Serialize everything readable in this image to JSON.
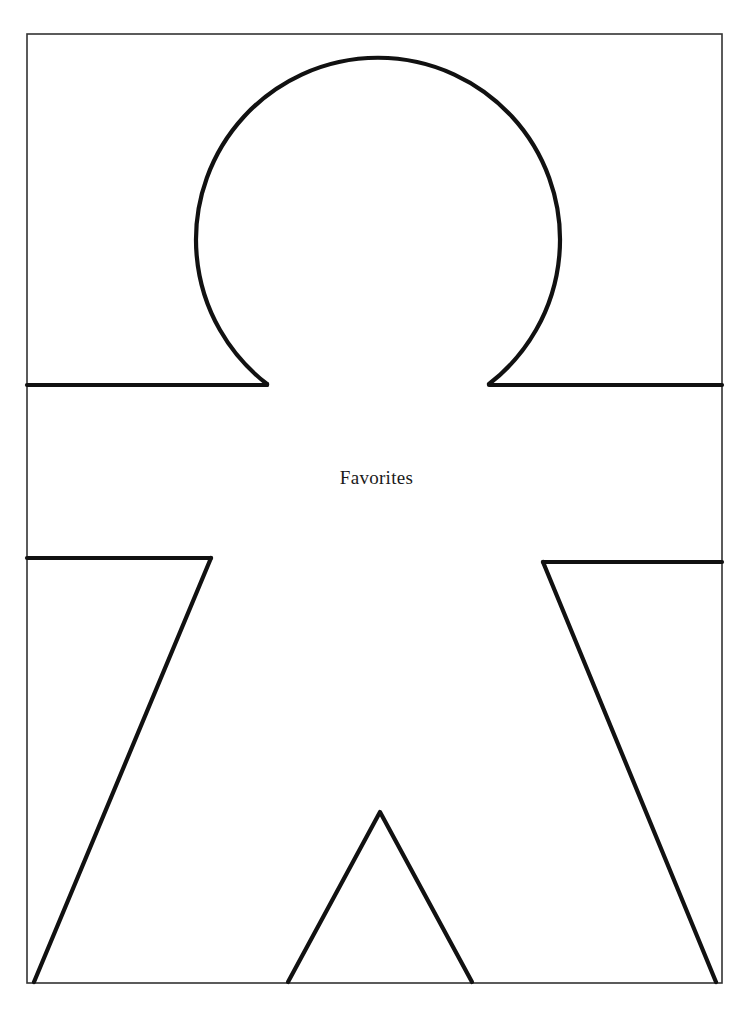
{
  "page": {
    "title": "Favorites",
    "width": 753,
    "height": 1009,
    "background_color": "#ffffff",
    "ink_color": "#111111",
    "border_color": "#333333"
  },
  "border": {
    "name": "page-border-frame",
    "x": 27,
    "y": 34,
    "width": 695,
    "height": 949,
    "stroke_width": 1.5
  },
  "figure": {
    "name": "paper-doll-outline",
    "stroke_width": 4,
    "head": {
      "center_x": 377,
      "center_y": 235,
      "radius": 182,
      "gap_start_deg": 68,
      "gap_end_deg": 112
    },
    "neck": {
      "left_x": 267,
      "right_x": 488,
      "y": 385
    },
    "shoulder_y": 385,
    "underarm_left_y": 558,
    "underarm_right_y": 562,
    "underarm_left_x": 210,
    "underarm_right_x": 543,
    "arm_left_foot_x": 33,
    "arm_right_foot_x": 716,
    "crotch": {
      "apex_x": 380,
      "apex_y": 812,
      "left_x": 288,
      "right_x": 472
    },
    "baseline_y": 983
  },
  "label": {
    "text": "Favorites",
    "font_size": 19,
    "color": "#1a1a1a",
    "center_x": 376,
    "top": 466
  }
}
